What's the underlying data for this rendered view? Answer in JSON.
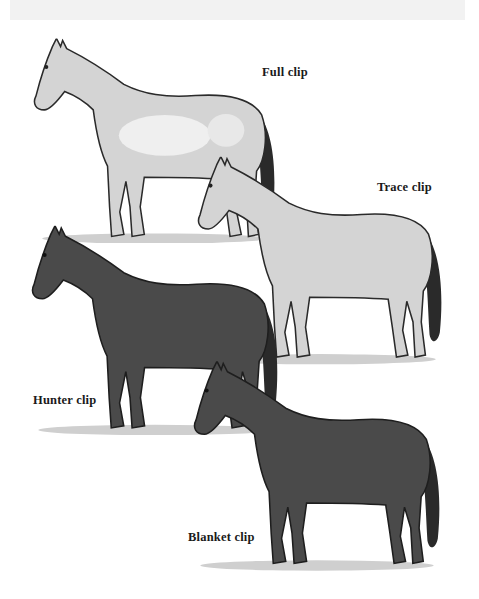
{
  "figure": {
    "background_color": "#ffffff",
    "colors": {
      "clipped": "#d6d6d6",
      "clipped_highlight": "#efefef",
      "coat": "#4a4a4a",
      "coat_dark": "#2e2e2e",
      "outline": "#1e1e1e",
      "grass": "#9a9a9a"
    },
    "horses": [
      {
        "id": "full",
        "label": "Full clip",
        "position": "top-left"
      },
      {
        "id": "trace",
        "label": "Trace clip",
        "position": "upper-right"
      },
      {
        "id": "hunter",
        "label": "Hunter clip",
        "position": "lower-left"
      },
      {
        "id": "blanket",
        "label": "Blanket clip",
        "position": "bottom-right"
      }
    ]
  }
}
